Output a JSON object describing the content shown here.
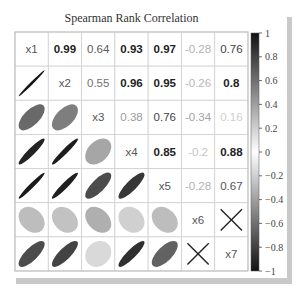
{
  "chart_data": {
    "type": "heatmap",
    "subtype": "correlation-matrix-ellipses",
    "title": "Spearman Rank Correlation",
    "variables": [
      "x1",
      "x2",
      "x3",
      "x4",
      "x5",
      "x6",
      "x7"
    ],
    "matrix": [
      [
        1,
        0.99,
        0.64,
        0.93,
        0.97,
        -0.28,
        0.76
      ],
      [
        0.99,
        1,
        0.55,
        0.96,
        0.95,
        -0.26,
        0.8
      ],
      [
        0.64,
        0.55,
        1,
        0.38,
        0.76,
        -0.34,
        0.16
      ],
      [
        0.93,
        0.96,
        0.38,
        1,
        0.85,
        -0.2,
        0.88
      ],
      [
        0.97,
        0.95,
        0.76,
        0.85,
        1,
        -0.28,
        0.67
      ],
      [
        -0.28,
        -0.26,
        -0.34,
        -0.2,
        -0.28,
        1,
        null
      ],
      [
        0.76,
        0.8,
        0.16,
        0.88,
        0.67,
        null,
        1
      ]
    ],
    "upper_labels": [
      [
        "",
        "0.99",
        "0.64",
        "0.93",
        "0.97",
        "-0.28",
        "0.76"
      ],
      [
        "",
        "",
        "0.55",
        "0.96",
        "0.95",
        "-0.26",
        "0.8"
      ],
      [
        "",
        "",
        "",
        "0.38",
        "0.76",
        "-0.34",
        "0.16"
      ],
      [
        "",
        "",
        "",
        "",
        "0.85",
        "-0.2",
        "0.88"
      ],
      [
        "",
        "",
        "",
        "",
        "",
        "-0.28",
        "0.67"
      ],
      [
        "",
        "",
        "",
        "",
        "",
        "",
        "X"
      ],
      [
        "",
        "",
        "",
        "",
        "",
        "",
        ""
      ]
    ],
    "insignificant_marker": "X",
    "insignificant_pairs": [
      [
        "x6",
        "x7"
      ]
    ],
    "upper": "numbers",
    "lower": "ellipses",
    "diagonal": "variable names",
    "colorbar": {
      "range": [
        -1,
        1
      ],
      "ticks": [
        "1",
        "0.8",
        "0.6",
        "0.4",
        "0.2",
        "0",
        "-0.2",
        "-0.4",
        "-0.6",
        "-0.8",
        "-1"
      ],
      "colormap": "grayscale: dark at ±1, white at 0"
    },
    "legend_position": "right"
  }
}
